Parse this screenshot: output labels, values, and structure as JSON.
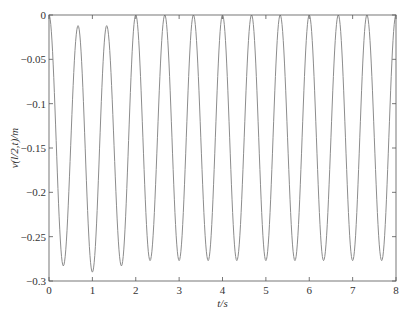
{
  "chart_data": {
    "type": "line",
    "title": "",
    "xlabel": "t/s",
    "ylabel": "v(l/2,t)/m",
    "xlim": [
      0,
      8
    ],
    "ylim": [
      -0.3,
      0
    ],
    "xticks": [
      0,
      1,
      2,
      3,
      4,
      5,
      6,
      7,
      8
    ],
    "yticks": [
      0,
      -0.05,
      -0.1,
      -0.15,
      -0.2,
      -0.25,
      -0.3
    ],
    "ytick_labels": [
      "0",
      "-0.05",
      "-0.1",
      "-0.15",
      "-0.2",
      "-0.25",
      "-0.3"
    ],
    "grid": false,
    "legend": null,
    "series": [
      {
        "name": "v(l/2,t)",
        "color": "#8c8c8c",
        "period": 0.667,
        "maxima": [
          {
            "t": 0.0,
            "v": 0.0
          },
          {
            "t": 0.67,
            "v": -0.012
          },
          {
            "t": 1.33,
            "v": -0.012
          },
          {
            "t": 2.0,
            "v": 0.0
          },
          {
            "t": 2.67,
            "v": 0.0
          },
          {
            "t": 3.33,
            "v": 0.0
          },
          {
            "t": 4.0,
            "v": 0.0
          },
          {
            "t": 4.67,
            "v": 0.0
          },
          {
            "t": 5.33,
            "v": 0.0
          },
          {
            "t": 6.0,
            "v": 0.0
          },
          {
            "t": 6.67,
            "v": 0.0
          },
          {
            "t": 7.33,
            "v": 0.0
          },
          {
            "t": 8.0,
            "v": 0.0
          }
        ],
        "minima": [
          {
            "t": 0.33,
            "v": -0.283
          },
          {
            "t": 1.0,
            "v": -0.29
          },
          {
            "t": 1.67,
            "v": -0.283
          },
          {
            "t": 2.33,
            "v": -0.277
          },
          {
            "t": 3.0,
            "v": -0.277
          },
          {
            "t": 3.67,
            "v": -0.277
          },
          {
            "t": 4.33,
            "v": -0.277
          },
          {
            "t": 5.0,
            "v": -0.277
          },
          {
            "t": 5.67,
            "v": -0.277
          },
          {
            "t": 6.33,
            "v": -0.277
          },
          {
            "t": 7.0,
            "v": -0.277
          },
          {
            "t": 7.67,
            "v": -0.277
          }
        ]
      }
    ]
  }
}
